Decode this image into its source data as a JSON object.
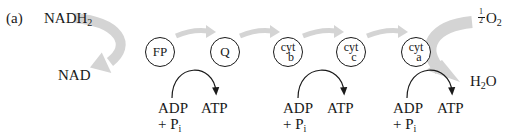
{
  "figure": {
    "panel_label": "(a)",
    "donor": {
      "reduced": "NADH",
      "reduced_subscript": "2",
      "oxidized": "NAD"
    },
    "acceptor": {
      "fraction_numerator": "1",
      "fraction_denominator": "2",
      "species": "O",
      "species_subscript": "2",
      "product": "H",
      "product_subscript": "2",
      "product_tail": "O"
    },
    "carriers": [
      {
        "id": "FP",
        "label": "FP",
        "type": "simple"
      },
      {
        "id": "Q",
        "label": "Q",
        "type": "simple"
      },
      {
        "id": "cyt-b",
        "label_top": "cyt",
        "label_bottom": "b",
        "type": "cyt"
      },
      {
        "id": "cyt-c",
        "label_top": "cyt",
        "label_bottom": "c",
        "type": "cyt"
      },
      {
        "id": "cyt-a",
        "label_top": "cyt",
        "label_bottom": "a",
        "type": "cyt"
      }
    ],
    "phosphorylation_sites": [
      {
        "substrate": "ADP",
        "plus_pi": "+ P",
        "pi_subscript": "i",
        "product": "ATP"
      },
      {
        "substrate": "ADP",
        "plus_pi": "+ P",
        "pi_subscript": "i",
        "product": "ATP"
      },
      {
        "substrate": "ADP",
        "plus_pi": "+ P",
        "pi_subscript": "i",
        "product": "ATP"
      }
    ],
    "colors": {
      "electron_flow_arrow": "#d4d4d4",
      "ink": "#1a1a1a"
    }
  }
}
